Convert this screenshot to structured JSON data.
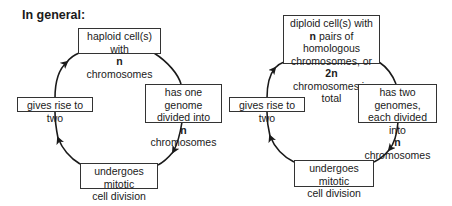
{
  "title": "In general:",
  "diagrams": [
    {
      "name": "haploid-cycle",
      "top": {
        "pre": "haploid cell(s) with",
        "n": "n",
        "post": " chromosomes"
      },
      "right": {
        "line1": "has one genome",
        "line2": "divided into",
        "n": "n",
        "post": " chromosomes"
      },
      "left": {
        "text": "gives rise to two"
      },
      "bottom": {
        "line1": "undergoes mitotic",
        "line2": "cell division"
      }
    },
    {
      "name": "diploid-cycle",
      "top": {
        "line1": "diploid cell(s) with",
        "n": "n",
        "line2post": " pairs of homologous",
        "line3pre": "chromosomes, or ",
        "twon": "2n",
        "line4": "chromosomes in total"
      },
      "right": {
        "line1": "has two genomes,",
        "line2": "each divided into",
        "n": "n",
        "post": " chromosomes"
      },
      "left": {
        "text": "gives rise to two"
      },
      "bottom": {
        "line1": "undergoes mitotic",
        "line2": "cell division"
      }
    }
  ],
  "colors": {
    "stroke": "#1a1a1a",
    "box_border": "#333333"
  }
}
